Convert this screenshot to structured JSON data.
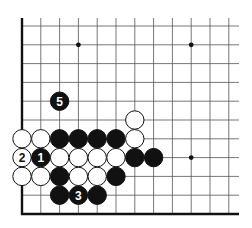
{
  "diagram": {
    "type": "go-board-corner",
    "corner": "bottom-left",
    "grid": {
      "columns": 12,
      "rows": 11,
      "origin_x": 22,
      "bottom_edge_y": 214,
      "spacing": 18.8,
      "right_extent_x": 239,
      "top_extent_y": 18,
      "line_color": "#555555",
      "edge_color": "#111111"
    },
    "star_points": [
      {
        "col": 3,
        "row": 9
      },
      {
        "col": 9,
        "row": 9
      },
      {
        "col": 9,
        "row": 3
      }
    ],
    "stones": [
      {
        "color": "black",
        "col": 2,
        "row": 1,
        "label": ""
      },
      {
        "color": "black",
        "col": 3,
        "row": 1,
        "label": "3"
      },
      {
        "color": "black",
        "col": 4,
        "row": 1,
        "label": ""
      },
      {
        "color": "white",
        "col": 0,
        "row": 2,
        "label": ""
      },
      {
        "color": "white",
        "col": 1,
        "row": 2,
        "label": ""
      },
      {
        "color": "black",
        "col": 2,
        "row": 2,
        "label": ""
      },
      {
        "color": "white",
        "col": 3,
        "row": 2,
        "label": ""
      },
      {
        "color": "white",
        "col": 4,
        "row": 2,
        "label": ""
      },
      {
        "color": "black",
        "col": 5,
        "row": 2,
        "label": ""
      },
      {
        "color": "white",
        "col": 0,
        "row": 3,
        "label": "2"
      },
      {
        "color": "black",
        "col": 1,
        "row": 3,
        "label": "1"
      },
      {
        "color": "white",
        "col": 2,
        "row": 3,
        "label": ""
      },
      {
        "color": "white",
        "col": 3,
        "row": 3,
        "label": ""
      },
      {
        "color": "white",
        "col": 4,
        "row": 3,
        "label": ""
      },
      {
        "color": "white",
        "col": 5,
        "row": 3,
        "label": ""
      },
      {
        "color": "black",
        "col": 6,
        "row": 3,
        "label": ""
      },
      {
        "color": "black",
        "col": 7,
        "row": 3,
        "label": ""
      },
      {
        "color": "white",
        "col": 0,
        "row": 4,
        "label": ""
      },
      {
        "color": "white",
        "col": 1,
        "row": 4,
        "label": ""
      },
      {
        "color": "black",
        "col": 2,
        "row": 4,
        "label": ""
      },
      {
        "color": "black",
        "col": 3,
        "row": 4,
        "label": ""
      },
      {
        "color": "black",
        "col": 4,
        "row": 4,
        "label": ""
      },
      {
        "color": "black",
        "col": 5,
        "row": 4,
        "label": ""
      },
      {
        "color": "white",
        "col": 6,
        "row": 4,
        "label": ""
      },
      {
        "color": "white",
        "col": 6,
        "row": 5,
        "label": ""
      },
      {
        "color": "black",
        "col": 2,
        "row": 6,
        "label": "5"
      }
    ],
    "move_labels": [
      "1",
      "2",
      "3",
      "5"
    ]
  }
}
